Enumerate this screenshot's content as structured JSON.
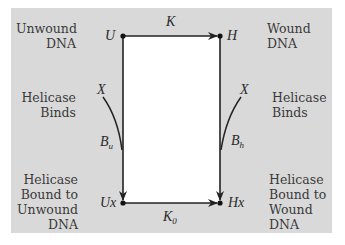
{
  "diagram": {
    "type": "kinetic-cycle",
    "background_color": "#d9d9d9",
    "inner_color": "#ffffff",
    "nodes": {
      "U": {
        "label": "U",
        "description": "Unwound DNA"
      },
      "H": {
        "label": "H",
        "description": "Wound DNA"
      },
      "Ux": {
        "label": "Ux",
        "description": "Helicase Bound to Unwound DNA"
      },
      "Hx": {
        "label": "Hx",
        "description": "Helicase Bound to Wound DNA"
      }
    },
    "edges": [
      {
        "from": "U",
        "to": "H",
        "label": "K"
      },
      {
        "from": "Ux",
        "to": "Hx",
        "label": "K",
        "label_sub": "0"
      },
      {
        "from": "U",
        "to": "Ux",
        "label": "B",
        "label_sub": "u",
        "with": "X"
      },
      {
        "from": "H",
        "to": "Hx",
        "label": "B",
        "label_sub": "h",
        "with": "X"
      }
    ],
    "side_labels": {
      "top_left": [
        "Unwound",
        "DNA"
      ],
      "top_right": [
        "Wound",
        "DNA"
      ],
      "mid_left": [
        "Helicase",
        "Binds"
      ],
      "mid_right": [
        "Helicase",
        "Binds"
      ],
      "bottom_left": [
        "Helicase",
        "Bound to",
        "Unwound",
        "DNA"
      ],
      "bottom_right": [
        "Helicase",
        "Bound to",
        "Wound",
        "DNA"
      ]
    },
    "symbols": {
      "x_left": "X",
      "x_right": "X",
      "k_top": "K",
      "k_bottom": "K",
      "k_bottom_sub": "0",
      "b_left": "B",
      "b_left_sub": "u",
      "b_right": "B",
      "b_right_sub": "h"
    }
  }
}
